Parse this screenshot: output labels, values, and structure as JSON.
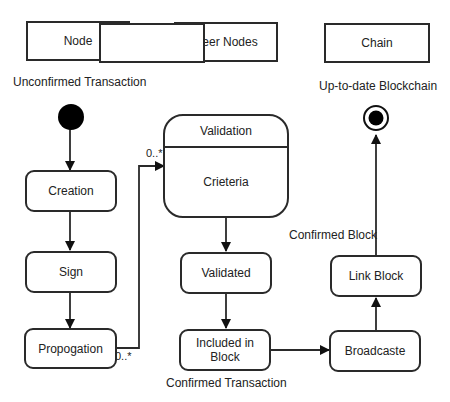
{
  "lanes": [
    {
      "label": "Node"
    },
    {
      "label": "Peer Nodes"
    },
    {
      "label": "Chain"
    }
  ],
  "annotations": {
    "start_label": "Unconfirmed Transaction",
    "end_label": "Up-to-date Blockchain",
    "confirmed_transaction": "Confirmed Transaction",
    "confirmed_block": "Confirmed Block",
    "multiplicity_source": "0..*",
    "multiplicity_target": "0..*"
  },
  "states": {
    "creation": "Creation",
    "sign": "Sign",
    "propogation": "Propogation",
    "validation_title": "Validation",
    "validation_body": "Crieteria",
    "validated": "Validated",
    "included_line1": "Included in",
    "included_line2": "Block",
    "broadcaste": "Broadcaste",
    "link_block": "Link Block"
  },
  "colors": {
    "stroke": "#2a2a2a",
    "fill": "#ffffff",
    "initial_node": "#000000"
  }
}
